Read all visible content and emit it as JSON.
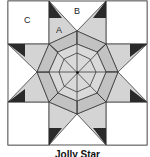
{
  "diagram": {
    "title": "Jolly Star",
    "labels": {
      "a": "A",
      "b": "B",
      "c": "C"
    },
    "colors": {
      "background": "#ffffff",
      "light": "#d9d9d9",
      "mid": "#bdbdbd",
      "dark": "#2a2a2a",
      "line": "#3a3a3a"
    }
  }
}
